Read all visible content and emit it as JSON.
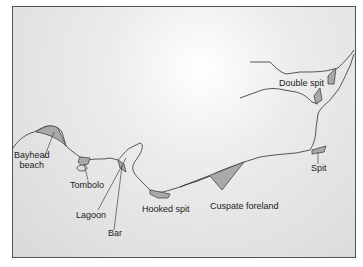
{
  "diagram": {
    "labels": {
      "bayhead_beach_1": "Bayhead",
      "bayhead_beach_2": "beach",
      "tombolo": "Tombolo",
      "lagoon": "Lagoon",
      "bar": "Bar",
      "hooked_spit": "Hooked spit",
      "cuspate_foreland": "Cuspate foreland",
      "spit": "Spit",
      "double_spit": "Double spit"
    },
    "colors": {
      "coastline": "#444444",
      "deposit": "#a9a9a9",
      "sea": "#e4e4e4"
    }
  }
}
